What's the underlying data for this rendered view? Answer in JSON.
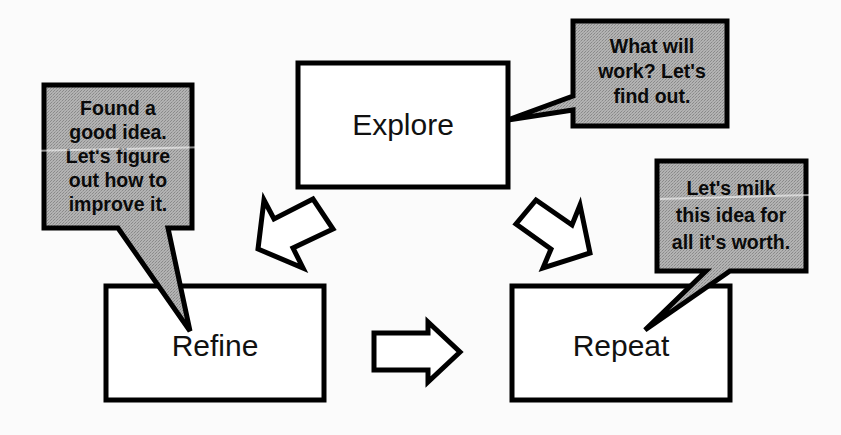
{
  "diagram": {
    "background_color": "#fbfbfb",
    "box_fill": "#ffffff",
    "callout_fill": "#a9a9a9",
    "stroke_color": "#000000",
    "boxes": [
      {
        "id": "explore",
        "label": "Explore",
        "x": 298,
        "y": 63,
        "width": 210,
        "height": 124
      },
      {
        "id": "refine",
        "label": "Refine",
        "x": 106,
        "y": 286,
        "width": 218,
        "height": 114
      },
      {
        "id": "repeat",
        "label": "Repeat",
        "x": 512,
        "y": 286,
        "width": 218,
        "height": 114
      }
    ],
    "callouts": [
      {
        "id": "explore-callout",
        "target": "explore",
        "lines": [
          "What will",
          "work? Let's",
          "find out."
        ],
        "x": 573,
        "y": 21,
        "width": 154,
        "height": 105,
        "tail_direction": "left"
      },
      {
        "id": "refine-callout",
        "target": "refine",
        "lines": [
          "Found a",
          "good idea.",
          "Let's  figure",
          "out how to",
          "improve it."
        ],
        "x": 44,
        "y": 85,
        "width": 148,
        "height": 143,
        "tail_direction": "down-right"
      },
      {
        "id": "repeat-callout",
        "target": "repeat",
        "lines": [
          "Let's milk",
          "this idea for",
          "all it's worth."
        ],
        "x": 657,
        "y": 161,
        "width": 149,
        "height": 110,
        "tail_direction": "down-left"
      }
    ],
    "arrows": [
      {
        "id": "explore-to-refine",
        "from": "explore",
        "to": "refine",
        "direction": "down-left"
      },
      {
        "id": "refine-to-repeat",
        "from": "refine",
        "to": "repeat",
        "direction": "right"
      },
      {
        "id": "repeat-to-explore",
        "from": "repeat",
        "to": "explore",
        "direction": "up-left"
      }
    ]
  }
}
